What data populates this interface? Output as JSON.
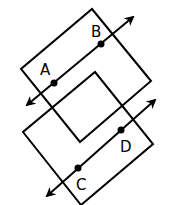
{
  "diagram": {
    "type": "geometry-parallel-planes",
    "colors": {
      "stroke": "#000000",
      "background": "#ffffff"
    },
    "planes": [
      {
        "name": "upper-plane",
        "vertices": [
          [
            92,
            9
          ],
          [
            151,
            81
          ],
          [
            80,
            142
          ],
          [
            21,
            69
          ]
        ]
      },
      {
        "name": "lower-plane",
        "vertices": [
          [
            95,
            72
          ],
          [
            153,
            144
          ],
          [
            81,
            205
          ],
          [
            23,
            132
          ]
        ]
      }
    ],
    "lines": [
      {
        "name": "line-AB",
        "from": [
          27,
          105
        ],
        "to": [
          133,
          17
        ],
        "arrows": "both"
      },
      {
        "name": "line-CD",
        "from": [
          47,
          196
        ],
        "to": [
          155,
          100
        ],
        "arrows": "both"
      }
    ],
    "points": [
      {
        "label": "A",
        "x": 54,
        "y": 83,
        "label_x": 40,
        "label_y": 75
      },
      {
        "label": "B",
        "x": 101,
        "y": 44,
        "label_x": 91,
        "label_y": 37
      },
      {
        "label": "C",
        "x": 78,
        "y": 168,
        "label_x": 76,
        "label_y": 190
      },
      {
        "label": "D",
        "x": 121,
        "y": 130,
        "label_x": 120,
        "label_y": 152
      }
    ]
  }
}
